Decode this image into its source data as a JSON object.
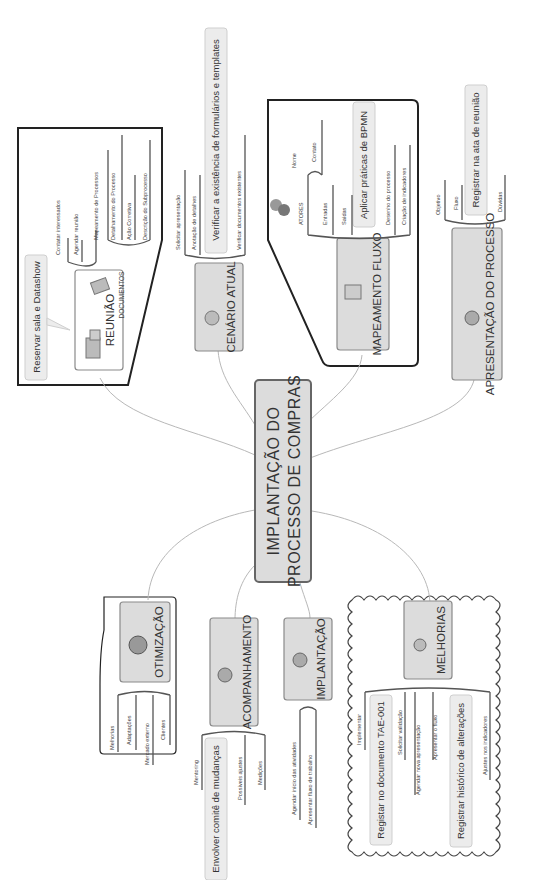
{
  "diagram": {
    "type": "mind-map",
    "orientation": "rotated 90 degrees clockwise",
    "colors": {
      "topic_fill": "#dcdcdc",
      "topic_border": "#8a8a8a",
      "callout_fill": "#ececec",
      "connector": "#b8b8b8",
      "boundary": "#222222"
    },
    "central_topic": {
      "line1": "IMPLANTAÇÃO DO",
      "line2": "PROCESSO DE COMPRAS"
    },
    "topics": {
      "reuniao": {
        "label": "REUNIÃO",
        "icon": "buildings-icon",
        "callout": "Reservar sala e Datashow",
        "children": [
          "Contatar interessados",
          "Agendar reunião"
        ],
        "documentos": {
          "label": "DOCUMENTOS",
          "icon": "documents-icon",
          "children": [
            "Mapeamento de Processos",
            "Detalhamento do Processo",
            "Ação Corretiva",
            "Descrição do Subprocesso"
          ]
        }
      },
      "cenario": {
        "label": "CENÁRIO ATUAL",
        "icon": "globe-icon",
        "callout": "Verificar a existência de formulários e templates",
        "children": [
          "Solicitar apresentação",
          "Anotação de detalhes",
          "Verificar documentos existentes"
        ]
      },
      "mapeamento": {
        "label": "MAPEAMENTO FLUXO",
        "icon": "flowchart-icon",
        "callout": "Aplicar práticas de BPMN",
        "atores": {
          "label": "ATORES",
          "icon": "people-icon",
          "children": [
            "Nome",
            "Contato"
          ]
        },
        "children": [
          "Entradas",
          "Saídas",
          "Desenho do processo",
          "Criação de indicadores"
        ]
      },
      "apresentacao": {
        "label": "APRESENTAÇÃO DO PROCESSO",
        "icon": "presenter-icon",
        "callout": "Registrar na ata de reunião",
        "children": [
          "Objetivo",
          "Fluxo",
          "Dúvidas"
        ]
      },
      "otimizacao": {
        "label": "OTIMIZAÇÃO",
        "icon": "world-icon",
        "children": [
          "Melhorias",
          "Adaptações",
          "Mercado externo",
          "Clientes"
        ]
      },
      "acompanhamento": {
        "label": "ACOMPANHAMENTO",
        "icon": "magnifier-icon",
        "callout": "Envolver comitê de mudanças",
        "children": [
          "Mentoring",
          "Possíveis ajustes",
          "Medições"
        ]
      },
      "implantacao": {
        "label": "IMPLANTAÇÃO",
        "icon": "gears-icon",
        "children": [
          "Agendar início das atividades",
          "Apresentar fluxo de trabalho"
        ]
      },
      "melhorias": {
        "label": "MELHORIAS",
        "icon": "lab-flask-icon",
        "callouts": [
          "Registar no documento TAE-001",
          "Registrar histórico de alterações"
        ],
        "children": [
          "Implementar",
          "Solicitar validação",
          "Agendar nova apresentação",
          "Apresentar o fluxo",
          "Ajustes nos indicadores"
        ]
      }
    }
  }
}
